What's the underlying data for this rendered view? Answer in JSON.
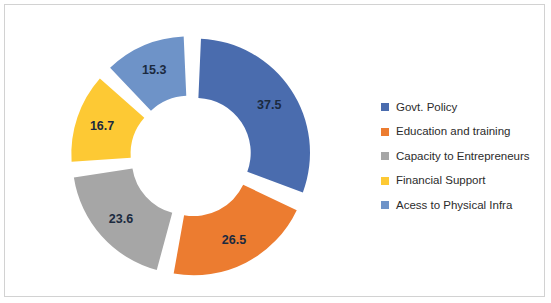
{
  "chart_data": {
    "type": "pie",
    "variant": "doughnut-exploded",
    "title": "",
    "categories": [
      "Govt. Policy",
      "Education and training",
      "Capacity to Entrepreneurs",
      "Financial Support",
      "Acess to Physical Infra"
    ],
    "values": [
      37.5,
      26.5,
      23.6,
      16.7,
      15.3
    ],
    "data_labels": [
      "37.5",
      "26.5",
      "23.6",
      "16.7",
      "15.3"
    ],
    "colors": [
      "#4a6cae",
      "#ec7c30",
      "#a6a6a6",
      "#fdc934",
      "#6e93c8"
    ],
    "total": 119.6,
    "legend_position": "right",
    "grid": false,
    "start_angle_deg": 0,
    "explode_gap_deg": 5,
    "inner_radius_ratio": 0.48
  },
  "legend": {
    "items": [
      {
        "label": "Govt. Policy",
        "color": "#4a6cae"
      },
      {
        "label": "Education and training",
        "color": "#ec7c30"
      },
      {
        "label": "Capacity to Entrepreneurs",
        "color": "#a6a6a6"
      },
      {
        "label": "Financial Support",
        "color": "#fdc934"
      },
      {
        "label": "Acess to Physical Infra",
        "color": "#6e93c8"
      }
    ]
  },
  "frame": {
    "border_color": "#d2d2d2",
    "background": "#ffffff"
  }
}
